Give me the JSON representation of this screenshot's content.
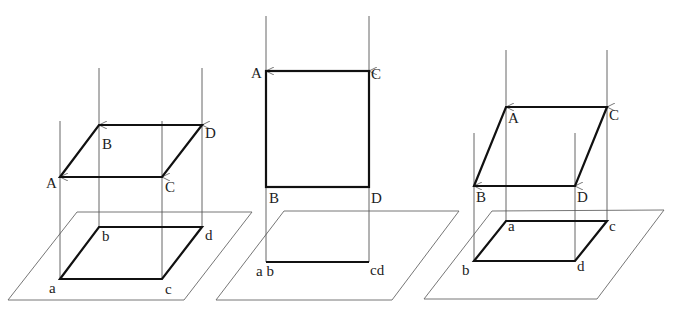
{
  "figures": [
    {
      "id": "oblique-left",
      "upper_labels": {
        "A": "A",
        "B": "B",
        "C": "C",
        "D": "D"
      },
      "lower_labels": {
        "a": "a",
        "b": "b",
        "c": "c",
        "d": "d"
      }
    },
    {
      "id": "perpendicular-middle",
      "upper_labels": {
        "A": "A",
        "B": "B",
        "C": "C",
        "D": "D"
      },
      "lower_labels": {
        "ab": "a b",
        "cd": "cd"
      }
    },
    {
      "id": "oblique-right",
      "upper_labels": {
        "A": "A",
        "B": "B",
        "C": "C",
        "D": "D"
      },
      "lower_labels": {
        "a": "a",
        "b": "b",
        "c": "c",
        "d": "d"
      }
    }
  ],
  "colors": {
    "line": "#111111",
    "projector": "#555555",
    "plane": "#666666"
  }
}
